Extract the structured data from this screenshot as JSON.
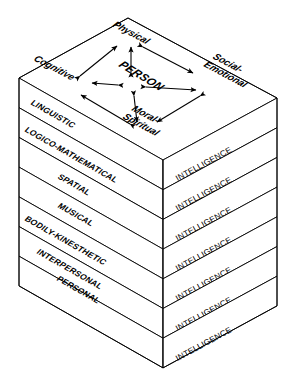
{
  "diagram": {
    "center_label": "PERSON",
    "dimensions": [
      {
        "id": "physical",
        "label": "Physical"
      },
      {
        "id": "cognitive",
        "label": "Cognitive"
      },
      {
        "id": "social-emotional",
        "label": "Social-\nEmotional"
      },
      {
        "id": "social-emotional-line1",
        "label": "Social-"
      },
      {
        "id": "social-emotional-line2",
        "label": "Emotional"
      },
      {
        "id": "moral-spiritual-line1",
        "label": "Moral-"
      },
      {
        "id": "moral-spiritual-line2",
        "label": "Spiritual"
      }
    ],
    "layers": [
      {
        "left": "LINGUISTIC",
        "right": "INTELLIGENCE"
      },
      {
        "left": "LOGICO-MATHEMATICAL",
        "right": "INTELLIGENCE"
      },
      {
        "left": "SPATIAL",
        "right": "INTELLIGENCE"
      },
      {
        "left": "MUSICAL",
        "right": "INTELLIGENCE"
      },
      {
        "left": "BODILY-KINESTHETIC",
        "right": "INTELLIGENCE"
      },
      {
        "left": "INTERPERSONAL",
        "right": "INTELLIGENCE"
      },
      {
        "left": "PERSONAL",
        "right": "INTELLIGENCE"
      }
    ],
    "colors": {
      "stroke": "#000000",
      "face": "#ffffff",
      "background": "#ffffff"
    }
  }
}
